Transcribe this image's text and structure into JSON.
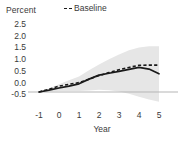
{
  "chart_data": {
    "type": "line",
    "title": "",
    "xlabel": "Year",
    "ylabel": "Percent",
    "ylim": [
      -0.5,
      2.5
    ],
    "xlim": [
      -1,
      5
    ],
    "grid": false,
    "legend_position": "top-center",
    "yticks": [
      "2.5",
      "2.0",
      "1.5",
      "1.0",
      "0.5",
      "0.0",
      "-0.5"
    ],
    "ytick_values": [
      2.5,
      2.0,
      1.5,
      1.0,
      0.5,
      0.0,
      -0.5
    ],
    "xticks": [
      "-1",
      "0",
      "1",
      "2",
      "3",
      "4",
      "5"
    ],
    "xtick_values": [
      -1,
      0,
      1,
      2,
      3,
      4,
      5
    ],
    "x": [
      -1,
      -0.5,
      0,
      0.5,
      1,
      1.5,
      2,
      2.5,
      3,
      3.5,
      4,
      4.5,
      5
    ],
    "series": [
      {
        "name": "Baseline",
        "style": "dashed",
        "color": "#1a1a1a",
        "values": [
          0.0,
          0.12,
          0.25,
          0.33,
          0.4,
          0.55,
          0.7,
          0.83,
          0.95,
          1.05,
          1.14,
          1.15,
          1.15
        ]
      },
      {
        "name": "",
        "style": "solid",
        "color": "#1a1a1a",
        "values": [
          0.0,
          0.08,
          0.17,
          0.25,
          0.35,
          0.55,
          0.72,
          0.8,
          0.88,
          0.97,
          1.05,
          0.98,
          0.78
        ]
      }
    ],
    "band": {
      "name": "confidence-band",
      "color": "#e6e6e6",
      "upper": [
        0.0,
        0.15,
        0.33,
        0.5,
        0.66,
        0.93,
        1.18,
        1.4,
        1.6,
        1.78,
        1.9,
        1.95,
        1.95
      ],
      "lower": [
        0.0,
        0.02,
        0.04,
        0.04,
        0.04,
        0.06,
        0.1,
        0.08,
        0.02,
        -0.08,
        -0.2,
        -0.32,
        -0.42
      ]
    },
    "zero_line": {
      "value": 0.0,
      "color": "#b5b5b5"
    }
  },
  "legend": {
    "entries": [
      {
        "label": "Baseline",
        "style": "dashed"
      }
    ]
  }
}
